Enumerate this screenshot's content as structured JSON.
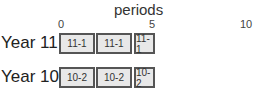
{
  "axis": {
    "title": "periods",
    "ticks": [
      {
        "label": "0",
        "x": 59
      },
      {
        "label": "5",
        "x": 149
      },
      {
        "label": "10",
        "x": 240
      }
    ]
  },
  "rows": [
    {
      "label": "Year 11",
      "blocks": [
        {
          "label": "11-1",
          "x": 59,
          "w": 36
        },
        {
          "label": "11-1",
          "x": 96,
          "w": 36
        },
        {
          "label": "11-1",
          "x": 134,
          "w": 21
        }
      ]
    },
    {
      "label": "Year 10",
      "blocks": [
        {
          "label": "10-2",
          "x": 59,
          "w": 36
        },
        {
          "label": "10-2",
          "x": 96,
          "w": 36
        },
        {
          "label": "10-2",
          "x": 134,
          "w": 21
        }
      ]
    }
  ]
}
